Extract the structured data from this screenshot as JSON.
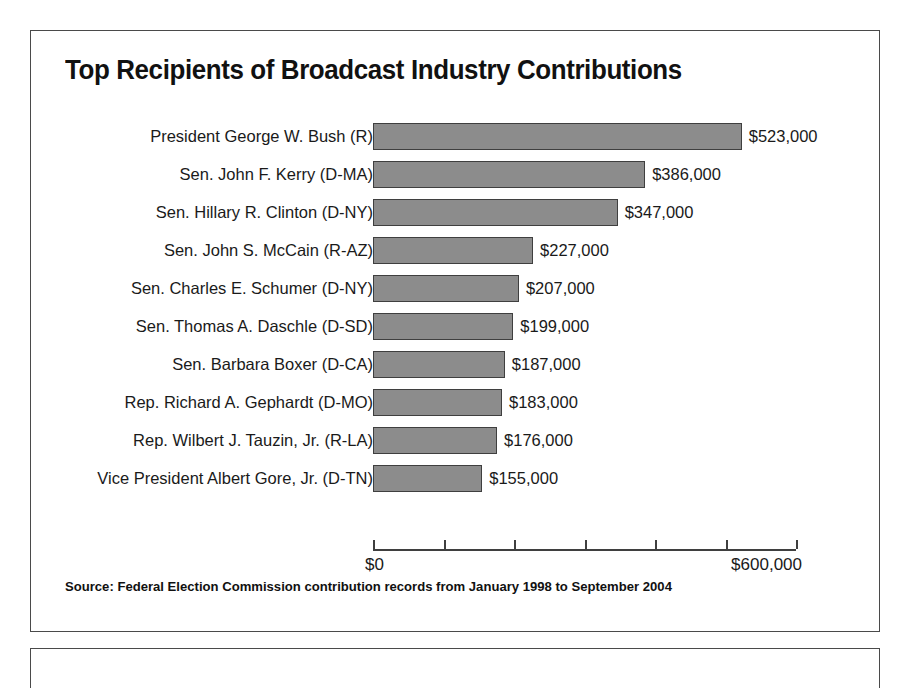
{
  "panel": {
    "title": "Top Recipients of Broadcast Industry Contributions",
    "source_note": "Source: Federal Election Commission contribution records from January 1998 to September 2004"
  },
  "colors": {
    "bar_fill": "#8c8c8c",
    "bar_stroke": "#3f3f3f",
    "frame": "#4a4a4a",
    "text": "#1a1a1a",
    "background": "#ffffff"
  },
  "chart_data": {
    "type": "bar",
    "orientation": "horizontal",
    "title": "Top Recipients of Broadcast Industry Contributions",
    "xlabel": "",
    "ylabel": "",
    "xlim": [
      0,
      600000
    ],
    "grid": false,
    "legend": null,
    "axis_tick_values": [
      0,
      100000,
      200000,
      300000,
      400000,
      500000,
      600000
    ],
    "axis_tick_labels_shown": [
      {
        "value": 0,
        "label": "$0"
      },
      {
        "value": 600000,
        "label": "$600,000"
      }
    ],
    "categories": [
      "President George W. Bush (R)",
      "Sen. John F. Kerry (D-MA)",
      "Sen. Hillary R. Clinton (D-NY)",
      "Sen. John S. McCain (R-AZ)",
      "Sen. Charles E. Schumer (D-NY)",
      "Sen. Thomas A. Daschle (D-SD)",
      "Sen. Barbara Boxer (D-CA)",
      "Rep. Richard A. Gephardt (D-MO)",
      "Rep. Wilbert J. Tauzin, Jr. (R-LA)",
      "Vice President Albert Gore, Jr. (D-TN)"
    ],
    "values": [
      523000,
      386000,
      347000,
      227000,
      207000,
      199000,
      187000,
      183000,
      176000,
      155000
    ],
    "value_labels": [
      "$523,000",
      "$386,000",
      "$347,000",
      "$227,000",
      "$207,000",
      "$199,000",
      "$187,000",
      "$183,000",
      "$176,000",
      "$155,000"
    ],
    "annotations": [
      "Source: Federal Election Commission contribution records from January 1998 to September 2004"
    ]
  }
}
